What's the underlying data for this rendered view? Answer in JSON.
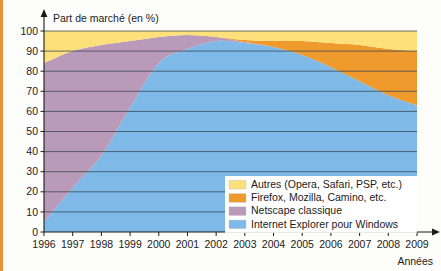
{
  "chart_data": {
    "type": "area",
    "stacked": true,
    "title": "",
    "ylabel": "Part de marché (en %)",
    "xlabel": "Années",
    "ylim": [
      0,
      100
    ],
    "yticks": [
      0,
      10,
      20,
      30,
      40,
      50,
      60,
      70,
      80,
      90,
      100
    ],
    "grid": true,
    "legend_position": "bottom-right",
    "categories": [
      1996,
      1997,
      1998,
      1999,
      2000,
      2001,
      2002,
      2003,
      2004,
      2005,
      2006,
      2007,
      2008,
      2009
    ],
    "xtick_labels": [
      "1996",
      "1997",
      "1998",
      "1999",
      "2000",
      "2001",
      "2002",
      "2003",
      "2004",
      "2005",
      "2006",
      "2007",
      "2008",
      "2009"
    ],
    "series": [
      {
        "name": "Internet Explorer pour Windows",
        "color": "#7fb9e8",
        "values": [
          5,
          22,
          38,
          62,
          84,
          91,
          95,
          94,
          92,
          88,
          82,
          75,
          68,
          63
        ]
      },
      {
        "name": "Netscape classique",
        "color": "#b99ab8",
        "values": [
          79,
          68,
          55,
          33,
          13,
          7,
          2,
          0.5,
          0,
          0,
          0,
          0,
          0,
          0
        ]
      },
      {
        "name": "Firefox, Mozilla, Camino, etc.",
        "color": "#ef9a2c",
        "values": [
          0,
          0,
          0,
          0,
          0,
          0,
          0,
          1,
          3,
          7,
          12,
          18,
          23,
          27
        ]
      },
      {
        "name": "Autres (Opera, Safari, PSP, etc.)",
        "color": "#fde07a",
        "values": [
          16,
          10,
          7,
          5,
          3,
          2,
          3,
          4.5,
          5,
          5,
          6,
          7,
          9,
          10
        ]
      }
    ],
    "legend_entries": [
      {
        "label": "Autres (Opera, Safari, PSP, etc.)",
        "color": "#fde07a"
      },
      {
        "label": "Firefox, Mozilla, Camino, etc.",
        "color": "#ef9a2c"
      },
      {
        "label": "Netscape classique",
        "color": "#b99ab8"
      },
      {
        "label": "Internet Explorer pour Windows",
        "color": "#7fb9e8"
      }
    ]
  },
  "colors": {
    "frame_border": "#e8923a",
    "background": "#fdfdfb",
    "gridline": "#3c4a52",
    "axis": "#1b1b1b",
    "ie_blue": "#7fb9e8",
    "netscape_purple": "#b99ab8",
    "firefox_orange": "#ef9a2c",
    "autres_yellow": "#fde07a"
  }
}
